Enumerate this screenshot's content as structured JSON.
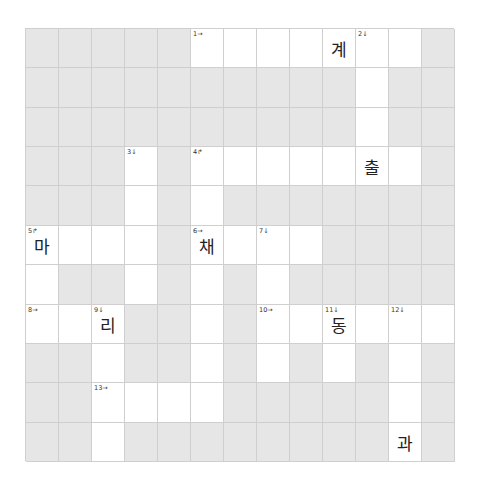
{
  "puzzle": {
    "type": "crossword",
    "cols": 13,
    "rows": 11,
    "colors": {
      "block": "#e6e6e6",
      "open": "#ffffff",
      "gridline": "#cfcfcf",
      "text": "#222222"
    },
    "layout": [
      "GGGGGWWWWWWWG",
      "GGGGGGGGGGWGG",
      "GGGGGGGGGGWGG",
      "GGGWGWWWWWWWG",
      "GGGWGWGGGGGGG",
      "WWWWGWWWWGGGG",
      "WGGWGWGWGGGGG",
      "WWWGGWGWWWWWW",
      "GGWGGWGWGWGWG",
      "GGWWWWGGGGGWG",
      "GGWGGGGGGGGWG"
    ],
    "clue_numbers": [
      {
        "row": 0,
        "col": 5,
        "label": "1→"
      },
      {
        "row": 0,
        "col": 10,
        "label": "2↓"
      },
      {
        "row": 3,
        "col": 3,
        "label": "3↓"
      },
      {
        "row": 3,
        "col": 5,
        "label": "4↱"
      },
      {
        "row": 5,
        "col": 0,
        "label": "5↱"
      },
      {
        "row": 5,
        "col": 5,
        "label": "6→"
      },
      {
        "row": 5,
        "col": 7,
        "label": "7↓"
      },
      {
        "row": 7,
        "col": 0,
        "label": "8→"
      },
      {
        "row": 7,
        "col": 2,
        "label": "9↓"
      },
      {
        "row": 7,
        "col": 7,
        "label": "10→"
      },
      {
        "row": 7,
        "col": 9,
        "label": "11↓"
      },
      {
        "row": 7,
        "col": 11,
        "label": "12↓"
      },
      {
        "row": 9,
        "col": 2,
        "label": "13→"
      }
    ],
    "letters": [
      {
        "row": 0,
        "col": 9,
        "char": "계"
      },
      {
        "row": 3,
        "col": 10,
        "char": "출"
      },
      {
        "row": 5,
        "col": 0,
        "char": "마"
      },
      {
        "row": 5,
        "col": 5,
        "char": "채"
      },
      {
        "row": 7,
        "col": 2,
        "char": "리"
      },
      {
        "row": 7,
        "col": 9,
        "char": "동"
      },
      {
        "row": 10,
        "col": 11,
        "char": "과"
      }
    ]
  }
}
